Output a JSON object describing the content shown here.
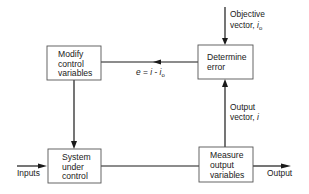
{
  "diagram": {
    "title": "",
    "blocks": {
      "modify": {
        "lines": [
          "Modify",
          "control",
          "variables"
        ]
      },
      "determine": {
        "lines": [
          "Determine",
          "error"
        ]
      },
      "system": {
        "lines": [
          "System",
          "under",
          "control"
        ]
      },
      "measure": {
        "lines": [
          "Measure",
          "output",
          "variables"
        ]
      }
    },
    "labels": {
      "objective_line1": "Objective",
      "objective_line2_prefix": "vector, ",
      "objective_var": "i",
      "objective_sub": "o",
      "error_e": "e",
      "error_eq": " = ",
      "error_i": "i",
      "error_minus": " - ",
      "error_i2": "i",
      "error_sub": "o",
      "output_vector_line1": "Output",
      "output_vector_line2_prefix": "vector, ",
      "output_vector_var": "i",
      "inputs": "Inputs",
      "output": "Output"
    },
    "connections": [
      {
        "from": "external",
        "to": "determine",
        "label": "Objective vector, i_o"
      },
      {
        "from": "determine",
        "to": "modify",
        "label": "e = i - i_o"
      },
      {
        "from": "modify",
        "to": "system",
        "label": ""
      },
      {
        "from": "external",
        "to": "system",
        "label": "Inputs"
      },
      {
        "from": "system",
        "to": "measure",
        "label": ""
      },
      {
        "from": "measure",
        "to": "determine",
        "label": "Output vector, i"
      },
      {
        "from": "measure",
        "to": "external",
        "label": "Output"
      }
    ]
  }
}
